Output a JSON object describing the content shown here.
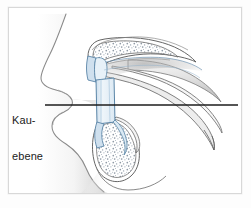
{
  "figure": {
    "kind": "anatomical-illustration",
    "language": "de",
    "background_color": "#ffffff",
    "frame_color": "#d8d8d8"
  },
  "annotations": {
    "occlusal_plane": {
      "label_line_1": "Kau-",
      "label_line_2": "ebene",
      "full_label": "Kauebene",
      "leader_line": {
        "color": "#1d1d1d",
        "x_start": 45,
        "x_end": 238,
        "y": 105,
        "thickness": 1.4
      }
    }
  },
  "structures": [
    {
      "name": "facial-profile-soft-tissue",
      "description": "nose, upper lip, lower lip and chin silhouette",
      "fill": "#f3f3f3",
      "stroke": "#7d7d7d"
    },
    {
      "name": "maxilla-cross-section",
      "description": "upper jaw with cancellous bone stippling and palatal extension",
      "fill": "#ffffff",
      "stroke": "#5a5a5a",
      "trabecular_texture": true
    },
    {
      "name": "mandible-cross-section",
      "description": "teardrop shaped lower jaw body with cancellous bone stippling",
      "fill": "#ffffff",
      "stroke": "#5a5a5a",
      "trabecular_texture": true
    },
    {
      "name": "alveolar-mucosa-band",
      "description": "pale blue tinted mucosa / denture bearing band between the jaws",
      "fill": "#e3eef6",
      "stroke": "#5b86a8"
    },
    {
      "name": "pterygoid-hamulus-curve",
      "description": "long curved process sweeping to the lower right",
      "fill": "#f5f5f5",
      "stroke": "#6b6b6b"
    }
  ],
  "colors": {
    "ink": "#1d1d1d",
    "bone_outline": "#5a5a5a",
    "mucosa_blue": "#5b86a8",
    "mucosa_fill": "#e3eef6",
    "shade_gray": "#bdbdbd",
    "paper": "#ffffff"
  }
}
